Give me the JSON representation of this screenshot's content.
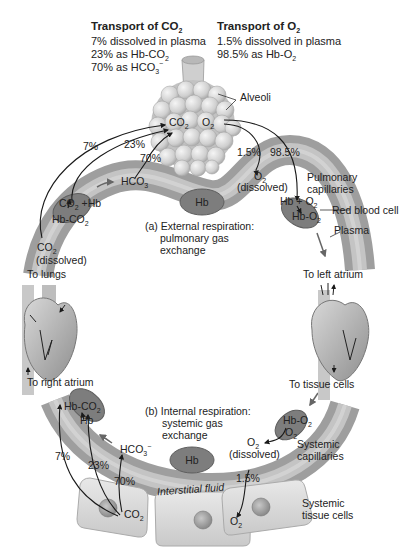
{
  "co2_transport": {
    "title": "Transport of CO",
    "title_sub": "2",
    "lines": [
      {
        "text": "7% dissolved in plasma",
        "sub": ""
      },
      {
        "text": "23% as Hb-CO",
        "sub": "2"
      },
      {
        "text": "70% as HCO",
        "sub": "3",
        "sup": "−"
      }
    ]
  },
  "o2_transport": {
    "title": "Transport of O",
    "title_sub": "2",
    "lines": [
      {
        "text": "1.5% dissolved in plasma",
        "sub": ""
      },
      {
        "text": "98.5% as Hb-O",
        "sub": "2"
      }
    ]
  },
  "labels": {
    "alveoli": "Alveoli",
    "alv_co2": "CO",
    "alv_o2": "O",
    "sub2": "2",
    "pct_7": "7%",
    "pct_23": "23%",
    "pct_70": "70%",
    "pct_1_5": "1.5%",
    "pct_98_5": "98.5%",
    "hco3": "HCO",
    "sub3": "3",
    "co2_hb": "CO",
    "plus_hb": " +Hb",
    "hb_co2": "Hb-CO",
    "co2_dissolved_a": "CO",
    "dissolved": "(dissolved)",
    "o2_dissolved": "O",
    "hb_plus_o2": "Hb + O",
    "hb_o2": "Hb-O",
    "hb": "Hb",
    "pulmonary_capillaries": [
      "Pulmonary",
      "capillaries"
    ],
    "red_blood_cell": "Red blood cell",
    "plasma": "Plasma",
    "external_resp": [
      "(a) External respiration:",
      "pulmonary gas",
      "exchange"
    ],
    "to_lungs": "To lungs",
    "to_left_atrium": "To left atrium",
    "to_right_atrium": "To right atrium",
    "to_tissue_cells": "To tissue cells",
    "internal_resp": [
      "(b) Internal respiration:",
      "systemic gas",
      "exchange"
    ],
    "systemic_capillaries": [
      "Systemic",
      "capillaries"
    ],
    "interstitial_fluid": "Interstitial fluid",
    "systemic_tissue_cells": [
      "Systemic",
      "tissue cells"
    ],
    "tissue_co2": "CO",
    "tissue_o2": "O"
  },
  "colors": {
    "vessel": "#a9a9a9",
    "vessel_highlight": "#d0d0d0",
    "rbc": "#7d7d7d",
    "rbc_edge": "#5e5e5e",
    "alveoli": "#d6d6d6",
    "tissue_cell": "#d9d9d9",
    "nucleus": "#9a9a9a",
    "arrow": "#1a1a1a"
  }
}
